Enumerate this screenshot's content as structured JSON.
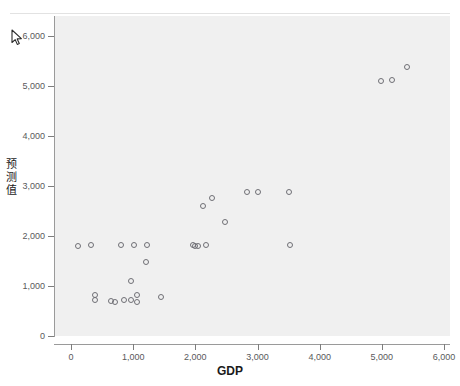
{
  "chart_data": {
    "type": "scatter",
    "title": "",
    "xlabel": "GDP",
    "ylabel": "预测值",
    "xlim": [
      -270,
      6400
    ],
    "ylim": [
      -320,
      6450
    ],
    "xticks": [
      0,
      1000,
      2000,
      3000,
      4000,
      5000,
      6000
    ],
    "xticklabels": [
      "0",
      "1,000",
      "2,000",
      "3,000",
      "4,000",
      "5,000",
      "6,000"
    ],
    "yticks": [
      0,
      1000,
      2000,
      3000,
      4000,
      5000,
      6000
    ],
    "yticklabels": [
      "0",
      "1,000",
      "2,000",
      "3,000",
      "4,000",
      "5,000",
      "6,000"
    ],
    "grid": false,
    "legend": null,
    "marker": "open-circle",
    "marker_color": "#6f6f75",
    "panel_color": "#f0f0f0",
    "points": [
      {
        "x": 120,
        "y": 1810
      },
      {
        "x": 320,
        "y": 1830
      },
      {
        "x": 390,
        "y": 830
      },
      {
        "x": 390,
        "y": 720
      },
      {
        "x": 640,
        "y": 700
      },
      {
        "x": 700,
        "y": 690
      },
      {
        "x": 800,
        "y": 1830
      },
      {
        "x": 860,
        "y": 720
      },
      {
        "x": 960,
        "y": 1100
      },
      {
        "x": 970,
        "y": 730
      },
      {
        "x": 1020,
        "y": 1830
      },
      {
        "x": 1060,
        "y": 830
      },
      {
        "x": 1060,
        "y": 690
      },
      {
        "x": 1200,
        "y": 1480
      },
      {
        "x": 1230,
        "y": 1830
      },
      {
        "x": 1450,
        "y": 790
      },
      {
        "x": 1960,
        "y": 1820
      },
      {
        "x": 1990,
        "y": 1800
      },
      {
        "x": 2040,
        "y": 1800
      },
      {
        "x": 2130,
        "y": 2600
      },
      {
        "x": 2170,
        "y": 1830
      },
      {
        "x": 2270,
        "y": 2760
      },
      {
        "x": 2470,
        "y": 2280
      },
      {
        "x": 2830,
        "y": 2880
      },
      {
        "x": 3010,
        "y": 2890
      },
      {
        "x": 3510,
        "y": 2890
      },
      {
        "x": 3520,
        "y": 1820
      },
      {
        "x": 4990,
        "y": 5100
      },
      {
        "x": 5160,
        "y": 5130
      },
      {
        "x": 5400,
        "y": 5390
      }
    ]
  },
  "cursor": {
    "name": "mouse-pointer",
    "x": 11,
    "y": 29
  }
}
